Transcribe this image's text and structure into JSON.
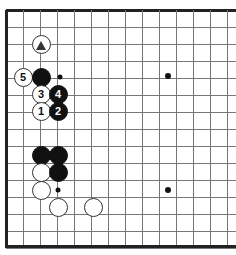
{
  "figure": {
    "kind": "go-board-diagram",
    "board_size": 19,
    "view": "top-left corner",
    "width": 236,
    "height": 255
  },
  "board": {
    "background_color": "#ffffff",
    "line_color": "#777777",
    "edge_color": "#222222",
    "grid_spacing": 17,
    "origin_x": 6,
    "origin_y": 10,
    "edge_line_width": 3,
    "grid_line_width": 1,
    "columns_visible": 14,
    "rows_visible": 14,
    "star_point_color": "#111111",
    "star_points": [
      {
        "name": "star-point-upper-right",
        "x": 168,
        "y": 76,
        "radius": 3
      },
      {
        "name": "star-point-lower-right",
        "x": 168,
        "y": 190,
        "radius": 3
      }
    ],
    "marked_intersections": [
      {
        "name": "intersection-dot-upper",
        "x": 60,
        "y": 77,
        "radius": 2.5
      },
      {
        "name": "intersection-dot-lower",
        "x": 58,
        "y": 190,
        "radius": 2.5
      }
    ]
  },
  "stones": [
    {
      "id": "white-triangle-marked",
      "color": "white",
      "x": 41,
      "y": 44,
      "radius": 9.5,
      "label": "",
      "mark": "triangle",
      "name": "stone-white-triangle"
    },
    {
      "id": "white-5",
      "color": "white",
      "x": 23,
      "y": 77,
      "radius": 9.5,
      "label": "5",
      "mark": "",
      "name": "stone-white-5"
    },
    {
      "id": "black-corner-high",
      "color": "black",
      "x": 41,
      "y": 77,
      "radius": 9.5,
      "label": "",
      "mark": "",
      "name": "stone-black-plain-a"
    },
    {
      "id": "white-3",
      "color": "white",
      "x": 41,
      "y": 94,
      "radius": 9.5,
      "label": "3",
      "mark": "",
      "name": "stone-white-3"
    },
    {
      "id": "black-4",
      "color": "black",
      "x": 58,
      "y": 94,
      "radius": 9.5,
      "label": "4",
      "mark": "",
      "name": "stone-black-4"
    },
    {
      "id": "white-1",
      "color": "white",
      "x": 41,
      "y": 111,
      "radius": 9.5,
      "label": "1",
      "mark": "",
      "name": "stone-white-1"
    },
    {
      "id": "black-2",
      "color": "black",
      "x": 58,
      "y": 111,
      "radius": 9.5,
      "label": "2",
      "mark": "",
      "name": "stone-black-2"
    },
    {
      "id": "black-lower-a",
      "color": "black",
      "x": 41,
      "y": 155,
      "radius": 9.5,
      "label": "",
      "mark": "",
      "name": "stone-black-plain-b"
    },
    {
      "id": "black-lower-b",
      "color": "black",
      "x": 58,
      "y": 155,
      "radius": 9.5,
      "label": "",
      "mark": "",
      "name": "stone-black-plain-c"
    },
    {
      "id": "white-lower-a",
      "color": "white",
      "x": 41,
      "y": 172,
      "radius": 9.5,
      "label": "",
      "mark": "",
      "name": "stone-white-plain-a"
    },
    {
      "id": "black-lower-c",
      "color": "black",
      "x": 58,
      "y": 172,
      "radius": 9.5,
      "label": "",
      "mark": "",
      "name": "stone-black-plain-d"
    },
    {
      "id": "white-lower-b",
      "color": "white",
      "x": 41,
      "y": 190,
      "radius": 9.5,
      "label": "",
      "mark": "",
      "name": "stone-white-plain-b"
    },
    {
      "id": "white-bottom-a",
      "color": "white",
      "x": 58,
      "y": 207,
      "radius": 9.5,
      "label": "",
      "mark": "",
      "name": "stone-white-plain-c"
    },
    {
      "id": "white-bottom-b",
      "color": "white",
      "x": 93,
      "y": 207,
      "radius": 9.5,
      "label": "",
      "mark": "",
      "name": "stone-white-plain-d"
    }
  ]
}
